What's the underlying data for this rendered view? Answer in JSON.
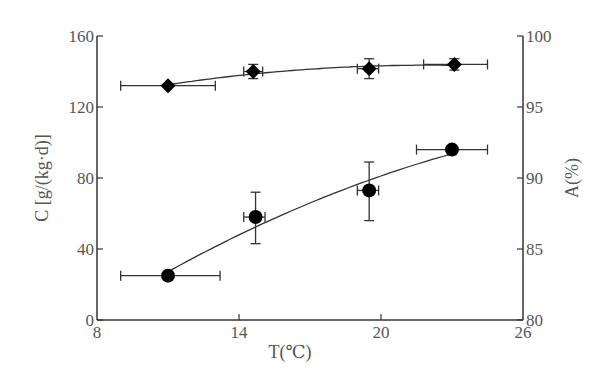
{
  "chart_data": {
    "type": "scatter",
    "title": "",
    "xlabel": "T(℃)",
    "ylabel": "C [g/(kg·d)]",
    "ylabel_right": "A(%)",
    "xlim": [
      8,
      26
    ],
    "ylim": [
      0,
      160
    ],
    "ylim_right": [
      80,
      100
    ],
    "x_ticks": [
      "8",
      "14",
      "20",
      "26"
    ],
    "y_ticks": [
      "0",
      "40",
      "80",
      "120",
      "160"
    ],
    "y_ticks_right": [
      "80",
      "85",
      "90",
      "95",
      "100"
    ],
    "grid": false,
    "legend": null,
    "series": [
      {
        "name": "C (circles, left axis)",
        "marker": "circle",
        "axis": "left",
        "x": [
          11.0,
          14.7,
          19.5,
          23.0
        ],
        "y": [
          25,
          58,
          73,
          96
        ],
        "x_err_low": [
          9.0,
          14.2,
          19.0,
          21.5
        ],
        "x_err_high": [
          13.2,
          15.1,
          19.9,
          24.5
        ],
        "y_err_low": [
          25,
          43,
          56,
          96
        ],
        "y_err_high": [
          25,
          72,
          89,
          96
        ],
        "fit_curve": true
      },
      {
        "name": "A (diamonds, right axis)",
        "marker": "diamond",
        "axis": "right",
        "x": [
          11.0,
          14.6,
          19.5,
          23.1
        ],
        "y": [
          96.5,
          97.5,
          97.7,
          98.0
        ],
        "x_err_low": [
          9.0,
          14.2,
          19.0,
          21.8
        ],
        "x_err_high": [
          13.0,
          15.0,
          19.9,
          24.5
        ],
        "y_err_low": [
          96.5,
          97.0,
          97.0,
          97.6
        ],
        "y_err_high": [
          96.5,
          98.0,
          98.4,
          98.4
        ],
        "fit_curve": true
      }
    ]
  }
}
